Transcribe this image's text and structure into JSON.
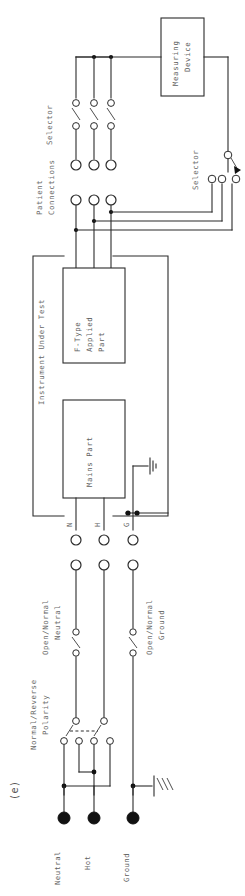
{
  "figure": {
    "caption": "(e)",
    "orientation": "rotated-90",
    "background_color": "#ffffff",
    "line_color": "#2b2b2b",
    "label_color": "#6a6a6a"
  },
  "blocks": {
    "measuring_device": {
      "line1": "Measuring",
      "line2": "Device"
    },
    "f_type_applied_part": {
      "line1": "F-Type",
      "line2": "Applied",
      "line3": "Part"
    },
    "mains_part": {
      "line1": "Mains Part"
    },
    "instrument_under_test": {
      "line1": "Instrument Under Test"
    }
  },
  "labels": {
    "selector_top": "Selector",
    "selector_right": "Selector",
    "patient_connections_line1": "Patient",
    "patient_connections_line2": "Connections",
    "open_normal_neutral_line1": "Open/Normal",
    "open_normal_neutral_line2": "Neutral",
    "open_normal_ground_line1": "Open/Normal",
    "open_normal_ground_line2": "Ground",
    "normal_reverse_polarity_line1": "Normal/Reverse",
    "normal_reverse_polarity_line2": "Polarity"
  },
  "terminals": {
    "iut_neutral": "N",
    "iut_hot": "H",
    "iut_ground": "G",
    "supply_neutral": "Neutral",
    "supply_hot": "Hot",
    "supply_ground": "Ground"
  },
  "counts": {
    "patient_connections": 3,
    "selector_top_poles": 3,
    "selector_right_contacts": 3,
    "polarity_switch_poles": 2,
    "polarity_switch_contacts": 4,
    "supply_terminals": 3
  },
  "icons": {
    "earth_ground_mains": "earth-ground-icon",
    "earth_ground_supply": "earth-ground-icon"
  }
}
